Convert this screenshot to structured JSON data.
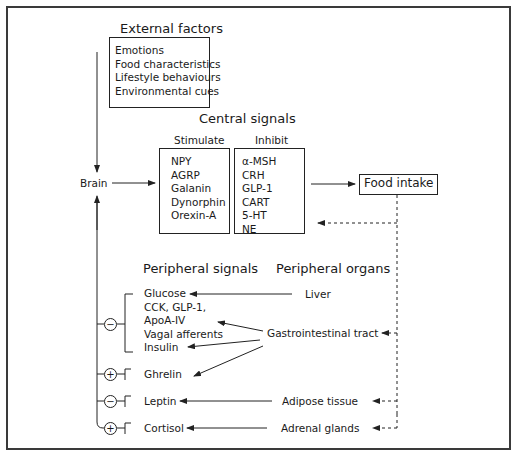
{
  "external": {
    "title": "External factors",
    "items": [
      "Emotions",
      "Food characteristics",
      "Lifestyle behaviours",
      "Environmental cues"
    ]
  },
  "brain": {
    "label": "Brain"
  },
  "central": {
    "title": "Central signals",
    "stimulate": {
      "label": "Stimulate",
      "items": [
        "NPY",
        "AGRP",
        "Galanin",
        "Dynorphin",
        "Orexin-A"
      ]
    },
    "inhibit": {
      "label": "Inhibit",
      "items": [
        "α-MSH",
        "CRH",
        "GLP-1",
        "CART",
        "5-HT",
        "NE"
      ]
    }
  },
  "food_intake": {
    "label": "Food intake"
  },
  "peripheral_signals": {
    "title": "Peripheral signals",
    "groups": [
      {
        "sign": "−",
        "items": [
          "Glucose",
          "CCK, GLP-1,",
          "ApoA-IV",
          "Vagal afferents",
          "Insulin"
        ]
      },
      {
        "sign": "+",
        "items": [
          "Ghrelin"
        ]
      },
      {
        "sign": "−",
        "items": [
          "Leptin"
        ]
      },
      {
        "sign": "+",
        "items": [
          "Cortisol"
        ]
      }
    ]
  },
  "peripheral_organs": {
    "title": "Peripheral organs",
    "items": [
      "Liver",
      "Gastrointestinal tract",
      "Adipose tissue",
      "Adrenal glands"
    ]
  }
}
